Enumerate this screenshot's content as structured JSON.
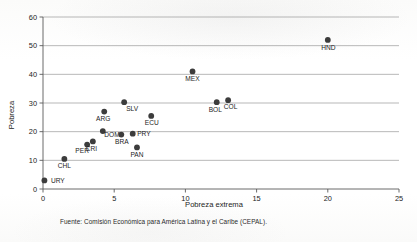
{
  "chart_data": {
    "type": "scatter",
    "title": "",
    "xlabel": "Pobreza extrema",
    "ylabel": "Pobreza",
    "xlim": [
      0,
      25
    ],
    "ylim": [
      0,
      60
    ],
    "xticks": [
      "0",
      "5",
      "10",
      "15",
      "20",
      "25"
    ],
    "yticks": [
      "0",
      "10",
      "20",
      "30",
      "40",
      "50",
      "60"
    ],
    "grid": "horizontal",
    "legend": "none",
    "point_color": "#3c3c3c",
    "points": [
      {
        "label": "URY",
        "x": 0.1,
        "y": 3.0
      },
      {
        "label": "CHL",
        "x": 1.5,
        "y": 10.5
      },
      {
        "label": "PER",
        "x": 3.1,
        "y": 15.5
      },
      {
        "label": "CRI",
        "x": 3.5,
        "y": 16.6
      },
      {
        "label": "DOM",
        "x": 4.2,
        "y": 20.2
      },
      {
        "label": "ARG",
        "x": 4.3,
        "y": 27.0
      },
      {
        "label": "BRA",
        "x": 5.5,
        "y": 19.0
      },
      {
        "label": "SLV",
        "x": 5.7,
        "y": 30.3
      },
      {
        "label": "PRY",
        "x": 6.3,
        "y": 19.3
      },
      {
        "label": "PAN",
        "x": 6.6,
        "y": 14.5
      },
      {
        "label": "ECU",
        "x": 7.6,
        "y": 25.5
      },
      {
        "label": "MEX",
        "x": 10.5,
        "y": 41.0
      },
      {
        "label": "BOL",
        "x": 12.2,
        "y": 30.3
      },
      {
        "label": "COL",
        "x": 13.0,
        "y": 31.0
      },
      {
        "label": "HND",
        "x": 20.0,
        "y": 52.0
      }
    ]
  },
  "footer": {
    "source": "Fuente: Comisión Económica para América Latina y el Caribe (CEPAL)."
  }
}
